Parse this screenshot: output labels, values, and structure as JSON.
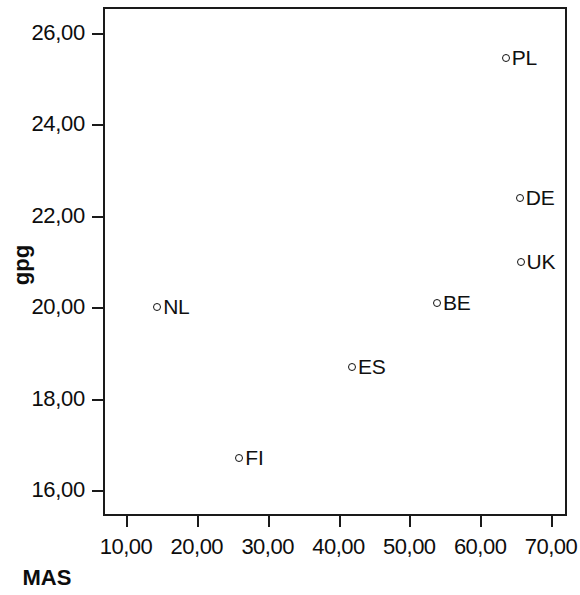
{
  "chart_data": {
    "type": "scatter",
    "title": "",
    "xlabel": "MAS",
    "ylabel": "gpg",
    "xlim": [
      6.5,
      72.5
    ],
    "ylim": [
      15.4,
      26.6
    ],
    "grid": false,
    "legend": "none",
    "decimal_separator": ",",
    "marker": "open-circle",
    "xticks": [
      10,
      20,
      30,
      40,
      50,
      60,
      70
    ],
    "xtick_labels": [
      "10,00",
      "20,00",
      "30,00",
      "40,00",
      "50,00",
      "60,00",
      "70,00"
    ],
    "yticks": [
      16,
      18,
      20,
      22,
      24,
      26
    ],
    "ytick_labels": [
      "16,00",
      "18,00",
      "20,00",
      "22,00",
      "24,00",
      "26,00"
    ],
    "points": [
      {
        "label": "PL",
        "x": 63.6,
        "y": 25.45,
        "label_side": "right"
      },
      {
        "label": "DE",
        "x": 65.6,
        "y": 22.4,
        "label_side": "right"
      },
      {
        "label": "UK",
        "x": 65.7,
        "y": 21.0,
        "label_side": "right"
      },
      {
        "label": "NL",
        "x": 14.4,
        "y": 20.0,
        "label_side": "right"
      },
      {
        "label": "BE",
        "x": 53.9,
        "y": 20.1,
        "label_side": "right"
      },
      {
        "label": "ES",
        "x": 41.9,
        "y": 18.7,
        "label_side": "right"
      },
      {
        "label": "FI",
        "x": 26.0,
        "y": 16.7,
        "label_side": "right"
      }
    ]
  },
  "colors": {
    "background": "#ffffff",
    "axis": "#1a1a1a",
    "marker": "#111111",
    "text": "#0d0d0d"
  }
}
